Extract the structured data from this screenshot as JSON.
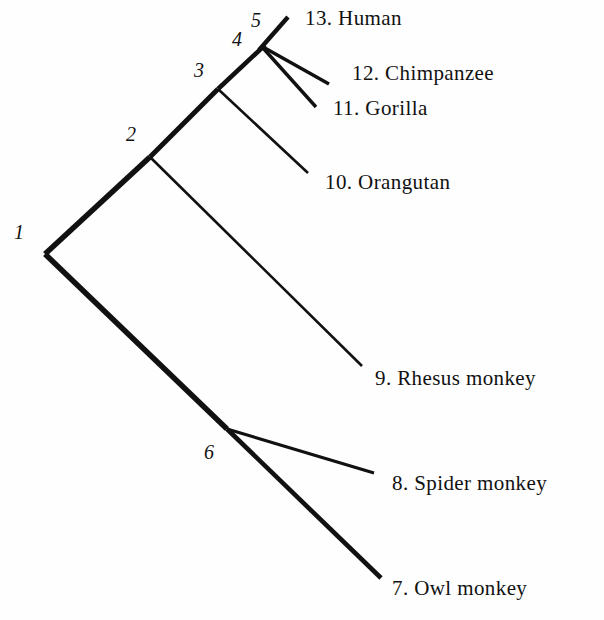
{
  "figure": {
    "type": "phylogenetic-tree",
    "background_color": "#fefefe",
    "line_color": "#111111",
    "width": 604,
    "height": 620
  },
  "taxa": [
    {
      "id": "human",
      "label": "13. Human",
      "number": "13",
      "name": "Human",
      "x": 305,
      "y": 8
    },
    {
      "id": "chimpanzee",
      "label": "12. Chimpanzee",
      "number": "12",
      "name": "Chimpanzee",
      "x": 352,
      "y": 63
    },
    {
      "id": "gorilla",
      "label": "11. Gorilla",
      "number": "11",
      "name": "Gorilla",
      "x": 333,
      "y": 98
    },
    {
      "id": "orangutan",
      "label": "10. Orangutan",
      "number": "10",
      "name": "Orangutan",
      "x": 325,
      "y": 172
    },
    {
      "id": "rhesus-monkey",
      "label": "9. Rhesus monkey",
      "number": "9",
      "name": "Rhesus monkey",
      "x": 375,
      "y": 368
    },
    {
      "id": "spider-monkey",
      "label": "8. Spider monkey",
      "number": "8",
      "name": "Spider monkey",
      "x": 392,
      "y": 473
    },
    {
      "id": "owl-monkey",
      "label": "7. Owl monkey",
      "number": "7",
      "name": "Owl monkey",
      "x": 392,
      "y": 578
    }
  ],
  "nodes": [
    {
      "id": "node-1",
      "label": "1",
      "vertex_x": 45,
      "vertex_y": 254,
      "label_x": 14,
      "label_y": 222
    },
    {
      "id": "node-2",
      "label": "2",
      "vertex_x": 150,
      "vertex_y": 157,
      "label_x": 126,
      "label_y": 124
    },
    {
      "id": "node-3",
      "label": "3",
      "vertex_x": 218,
      "vertex_y": 89,
      "label_x": 194,
      "label_y": 60
    },
    {
      "id": "node-4",
      "label": "4",
      "vertex_x": 255,
      "vertex_y": 54,
      "label_x": 232,
      "label_y": 29
    },
    {
      "id": "node-5",
      "label": "5",
      "vertex_x": 265,
      "vertex_y": 45,
      "label_x": 251,
      "label_y": 10
    },
    {
      "id": "node-6",
      "label": "6",
      "vertex_x": 227,
      "vertex_y": 429,
      "label_x": 204,
      "label_y": 442
    }
  ],
  "branches": [
    {
      "id": "branch-root-to-node2",
      "from": "node-1",
      "to": "node-2",
      "x1": 45,
      "y1": 254,
      "x2": 150,
      "y2": 157,
      "width": 5.5
    },
    {
      "id": "branch-root-to-node6",
      "from": "node-1",
      "to": "node-6",
      "x1": 45,
      "y1": 254,
      "x2": 227,
      "y2": 429,
      "width": 5.5
    },
    {
      "id": "branch-node2-to-node3",
      "from": "node-2",
      "to": "node-3",
      "x1": 150,
      "y1": 157,
      "x2": 218,
      "y2": 89,
      "width": 5.0
    },
    {
      "id": "branch-node2-to-rhesus",
      "from": "node-2",
      "to": "rhesus-monkey",
      "x1": 150,
      "y1": 157,
      "x2": 362,
      "y2": 366,
      "width": 2.6
    },
    {
      "id": "branch-node3-to-node5",
      "from": "node-3",
      "to": "node-5",
      "x1": 218,
      "y1": 89,
      "x2": 265,
      "y2": 45,
      "width": 4.6
    },
    {
      "id": "branch-node3-to-orangutan",
      "from": "node-3",
      "to": "orangutan",
      "x1": 218,
      "y1": 89,
      "x2": 308,
      "y2": 173,
      "width": 2.6
    },
    {
      "id": "branch-node5-to-human",
      "from": "node-5",
      "to": "human",
      "x1": 259,
      "y1": 50,
      "x2": 288,
      "y2": 17,
      "width": 4.4
    },
    {
      "id": "branch-node5-to-chimpanzee",
      "from": "node-5",
      "to": "chimpanzee",
      "x1": 263,
      "y1": 47,
      "x2": 329,
      "y2": 84,
      "width": 3.4
    },
    {
      "id": "branch-node5-to-gorilla",
      "from": "node-5",
      "to": "gorilla",
      "x1": 263,
      "y1": 48,
      "x2": 316,
      "y2": 107,
      "width": 3.4
    },
    {
      "id": "branch-node6-to-spider",
      "from": "node-6",
      "to": "spider-monkey",
      "x1": 227,
      "y1": 429,
      "x2": 374,
      "y2": 473,
      "width": 3.2
    },
    {
      "id": "branch-node6-to-owl",
      "from": "node-6",
      "to": "owl-monkey",
      "x1": 227,
      "y1": 429,
      "x2": 381,
      "y2": 578,
      "width": 4.6
    }
  ]
}
